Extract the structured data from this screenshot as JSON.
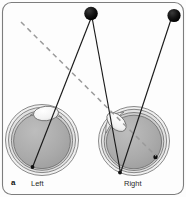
{
  "figure": {
    "panel_letter": "a",
    "caption_labels": {
      "left_eye": "Left",
      "right_eye": "Right"
    },
    "colors": {
      "frame_border": "#7d7d7d",
      "background": "#fdfdfd",
      "target_dot": "#111111",
      "ray_solid": "#1a1a1a",
      "ray_dashed": "#9a9a9a",
      "sclera_outer": "#efefef",
      "sclera_mid": "#d9d9d9",
      "vitreous": "#a9a9a9",
      "retina_outline": "#5d5d5d",
      "lens_fill": "#f4f4f4",
      "fovea_dot": "#101010"
    },
    "geometry": {
      "width": 186,
      "height": 197,
      "frame": {
        "x": 2.5,
        "y": 2.5,
        "w": 181,
        "h": 192,
        "rx": 9
      },
      "targets": [
        {
          "name": "fixation-target-near",
          "cx": 91,
          "cy": 13.5,
          "r": 6.8
        },
        {
          "name": "fixation-target-far",
          "cx": 174,
          "cy": 15.5,
          "r": 6.6
        }
      ],
      "left_eye": {
        "cx": 42,
        "cy": 140,
        "rx": 36,
        "ry": 35,
        "lens": {
          "cx": 46,
          "cy": 113,
          "rx": 12.5,
          "ry": 7.2,
          "rotate": -6
        },
        "image_point": {
          "cx": 32.5,
          "cy": 167,
          "r": 1.9
        }
      },
      "right_eye": {
        "cx": 134,
        "cy": 141,
        "rx": 35,
        "ry": 34,
        "lens": {
          "cx": 116,
          "cy": 122,
          "rx": 11.5,
          "ry": 7.0,
          "rotate": 44
        },
        "image_point": {
          "cx": 120,
          "cy": 173,
          "r": 1.9
        },
        "eccentric_point": {
          "cx": 155.5,
          "cy": 157,
          "r": 2.2
        }
      },
      "rays_solid": [
        {
          "name": "ray-near-target-to-left-eye",
          "x1": 91,
          "y1": 20,
          "x2": 33,
          "y2": 166
        },
        {
          "name": "ray-near-target-to-right-eye",
          "x1": 92,
          "y1": 20.5,
          "x2": 120.5,
          "y2": 172
        },
        {
          "name": "ray-far-target-to-right-eye",
          "x1": 171,
          "y1": 21,
          "x2": 121,
          "y2": 172
        }
      ],
      "ray_dashed": {
        "name": "deviated-visual-axis",
        "x1": 21,
        "y1": 22,
        "x2": 156,
        "y2": 156,
        "dash": "5 4"
      }
    }
  }
}
